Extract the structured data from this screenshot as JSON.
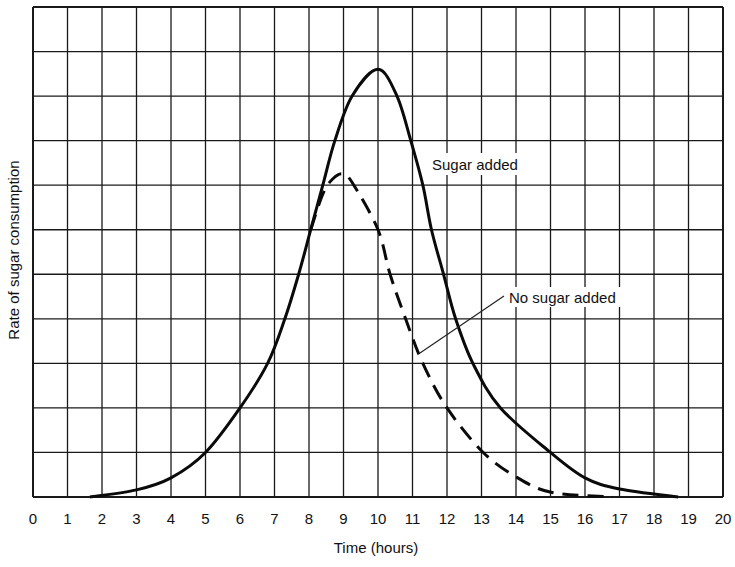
{
  "chart_data": {
    "type": "line",
    "title": "",
    "xlabel": "Time (hours)",
    "ylabel": "Rate of sugar consumption",
    "xlim": [
      0,
      20
    ],
    "ylim": [
      0,
      11
    ],
    "x_ticks": [
      "0",
      "1",
      "2",
      "3",
      "4",
      "5",
      "6",
      "7",
      "8",
      "9",
      "10",
      "11",
      "12",
      "13",
      "14",
      "15",
      "16",
      "17",
      "18",
      "19",
      "20"
    ],
    "y_ticks": [],
    "grid": true,
    "legend": null,
    "series": [
      {
        "name": "Sugar added",
        "style": "solid",
        "x": [
          1.65,
          3.0,
          4.0,
          5.0,
          6.0,
          6.8,
          7.3,
          7.7,
          8.05,
          8.4,
          8.75,
          9.25,
          10.0,
          10.55,
          10.95,
          11.3,
          11.55,
          11.9,
          12.25,
          12.75,
          13.55,
          15.0,
          16.0,
          17.0,
          18.7
        ],
        "y": [
          0,
          0.16,
          0.43,
          1.0,
          2.0,
          3.0,
          4.0,
          5.0,
          6.0,
          7.0,
          8.0,
          9.0,
          9.6,
          9.0,
          8.0,
          7.0,
          6.0,
          5.0,
          4.0,
          3.0,
          2.0,
          1.0,
          0.43,
          0.18,
          0
        ]
      },
      {
        "name": "No sugar added",
        "style": "dashed",
        "x": [
          8.05,
          8.4,
          8.7,
          9.0,
          9.3,
          10.0,
          10.35,
          10.8,
          11.3,
          12.0,
          13.05,
          14.05,
          15.05,
          16.8
        ],
        "y": [
          6.0,
          6.8,
          7.15,
          7.25,
          7.0,
          6.0,
          5.0,
          4.0,
          3.0,
          2.0,
          1.0,
          0.43,
          0.1,
          0
        ]
      }
    ],
    "annotations": [
      {
        "text": "Sugar added",
        "x": 11.6,
        "y": 7.4,
        "target_series": "Sugar added"
      },
      {
        "text": "No sugar added",
        "x": 13.8,
        "y": 4.5,
        "target_series": "No sugar added",
        "leader_from": [
          11.3,
          3.2
        ],
        "leader_to": [
          13.6,
          4.5
        ]
      }
    ]
  },
  "labels": {
    "sugar_added": "Sugar added",
    "no_sugar_added": "No sugar added"
  }
}
